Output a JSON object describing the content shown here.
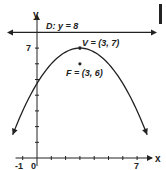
{
  "chart_data": {
    "type": "line",
    "title": "",
    "xlabel": "x",
    "ylabel": "y",
    "xlim": [
      -1.5,
      8.5
    ],
    "ylim": [
      -0.5,
      9
    ],
    "x_ticks": [
      -1,
      0,
      1,
      2,
      3,
      4,
      5,
      6,
      7
    ],
    "x_tick_labels": [
      {
        "value": -1,
        "label": "-1"
      },
      {
        "value": 0,
        "label": "0"
      },
      {
        "value": 7,
        "label": "7"
      }
    ],
    "y_ticks": [
      1,
      2,
      3,
      4,
      5,
      6,
      7
    ],
    "y_tick_labels": [
      {
        "value": 7,
        "label": "7"
      }
    ],
    "directrix": {
      "y": 8,
      "label": "D: y = 8"
    },
    "vertex": {
      "x": 3,
      "y": 7,
      "label": "V = (3, 7)"
    },
    "focus": {
      "x": 3,
      "y": 6,
      "label": "F = (3, 6)"
    },
    "parabola": {
      "equation": "y = 7 - (x - 3)^2 / 4",
      "x_range": [
        -1.7,
        7.7
      ]
    },
    "grid": false,
    "colors": {
      "ink": "#222222"
    }
  }
}
